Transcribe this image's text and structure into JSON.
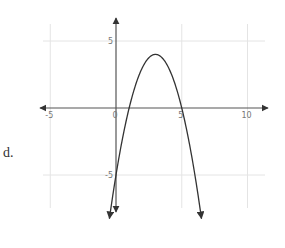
{
  "problem_label": "d.",
  "chart_data": {
    "type": "line",
    "title": "",
    "function": "y = -(x - 1)(x - 5) = -x^2 + 6x - 5",
    "vertex": [
      3,
      4
    ],
    "x_intercepts": [
      1,
      5
    ],
    "y_intercept": -5,
    "series": [
      {
        "name": "parabola",
        "x": [
          -0.3,
          0,
          0.5,
          1,
          1.5,
          2,
          2.5,
          3,
          3.5,
          4,
          4.5,
          5,
          5.5,
          6,
          6.3
        ],
        "y": [
          -6.89,
          -5,
          -2.25,
          0,
          1.75,
          3,
          3.75,
          4,
          3.75,
          3,
          1.75,
          0,
          -2.25,
          -5,
          -6.89
        ]
      }
    ],
    "xlabel": "",
    "ylabel": "",
    "x_ticks": [
      "-5",
      "0",
      "5",
      "10"
    ],
    "y_ticks": [
      "5",
      "-5"
    ],
    "xlim": [
      -6,
      11
    ],
    "ylim": [
      -7.5,
      6.5
    ],
    "grid": true
  }
}
